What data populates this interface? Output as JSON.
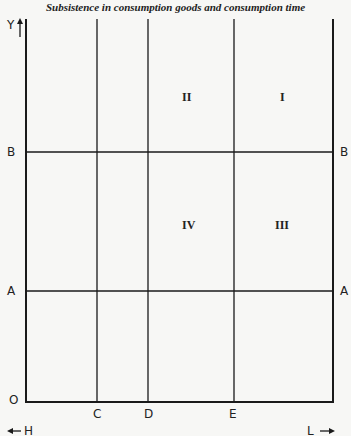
{
  "title": "Subsistence in consumption goods and consumption time",
  "axes": {
    "y_label": "Y",
    "origin_label": "O",
    "left_arrow_label": "H",
    "right_arrow_label": "L"
  },
  "horizontal_lines": [
    {
      "label_left": "B",
      "label_right": "B"
    },
    {
      "label_left": "A",
      "label_right": "A"
    }
  ],
  "vertical_lines": [
    {
      "label": "C"
    },
    {
      "label": "D"
    },
    {
      "label": "E"
    }
  ],
  "regions": [
    {
      "label": "II"
    },
    {
      "label": "I"
    },
    {
      "label": "IV"
    },
    {
      "label": "III"
    }
  ],
  "colors": {
    "line": "#1a1a1a",
    "background": "#f7f7f5"
  }
}
